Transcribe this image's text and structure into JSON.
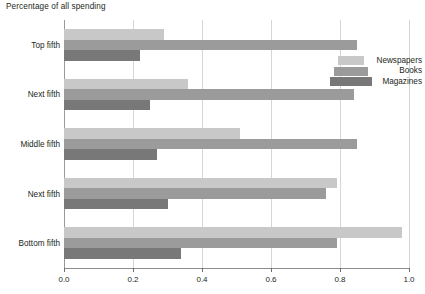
{
  "chart_data": {
    "type": "bar",
    "orientation": "horizontal",
    "title": "Percentage of all spending",
    "xlabel": "",
    "ylabel": "",
    "xlim": [
      0.0,
      1.0
    ],
    "grid": true,
    "legend_position": "top-right-inside",
    "categories": [
      "Top fifth",
      "Next fifth",
      "Middle fifth",
      "Next fifth",
      "Bottom fifth"
    ],
    "xticks": [
      "0.0",
      "0.2",
      "0.4",
      "0.6",
      "0.8",
      "1.0"
    ],
    "xtick_values": [
      0.0,
      0.2,
      0.4,
      0.6,
      0.8,
      1.0
    ],
    "series": [
      {
        "name": "Newspapers",
        "color": "#c8c8c8",
        "values": [
          0.29,
          0.36,
          0.51,
          0.79,
          0.98
        ]
      },
      {
        "name": "Books",
        "color": "#9b9b9b",
        "values": [
          0.85,
          0.84,
          0.85,
          0.76,
          0.79
        ]
      },
      {
        "name": "Magazines",
        "color": "#787878",
        "values": [
          0.22,
          0.25,
          0.27,
          0.3,
          0.34
        ]
      }
    ]
  },
  "colors": {
    "newspapers": "#c8c8c8",
    "books": "#9b9b9b",
    "magazines": "#787878",
    "gridline": "#d6d6d6",
    "axis": "#8c8c8c",
    "text": "#231f20",
    "background": "#ffffff"
  }
}
